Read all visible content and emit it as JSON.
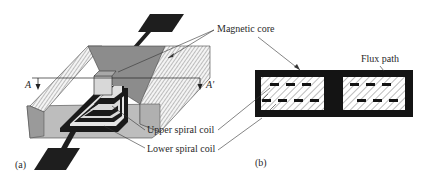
{
  "figure": {
    "panel_a": {
      "label": "(a)",
      "section_marker_left": "A",
      "section_marker_right": "A'",
      "callouts": {
        "magnetic_core": "Magnetic core",
        "upper_spiral_coil": "Upper spiral coil",
        "lower_spiral_coil": "Lower spiral coil"
      }
    },
    "panel_b": {
      "label": "(b)",
      "callouts": {
        "flux_path": "Flux path"
      },
      "upper_row_conductors_left": 3,
      "lower_row_conductors_left": 4,
      "upper_row_conductors_right": 3,
      "lower_row_conductors_right": 3
    },
    "colors": {
      "ink": "#1a1a1a",
      "core_gray": "#8c8c8c",
      "light_gray": "#cfcfcf",
      "hatch_bg": "#f2f2f2"
    }
  }
}
